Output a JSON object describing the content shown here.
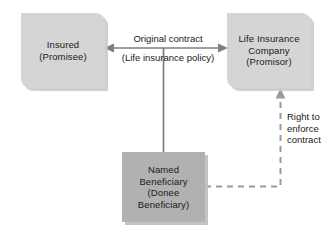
{
  "diagram": {
    "colors": {
      "box_light_fill": "#d5d5d5",
      "box_dark_fill": "#b1b1b1",
      "box_shadow": "#c8c8c8",
      "connector": "#7f7f7f",
      "text": "#1a1a1a",
      "background": "#ffffff"
    },
    "nodes": [
      {
        "id": "insured",
        "label": "Insured\n(Promisee)",
        "line1": "Insured",
        "line2": "(Promisee)",
        "style": "light"
      },
      {
        "id": "insurer",
        "label": "Life Insurance\nCompany\n(Promisor)",
        "line1": "Life Insurance",
        "line2": "Company",
        "line3": "(Promisor)",
        "style": "light"
      },
      {
        "id": "beneficiary",
        "label": "Named\nBeneficiary\n(Donee\nBeneficiary)",
        "line1": "Named",
        "line2": "Beneficiary",
        "line3": "(Donee",
        "line4": "Beneficiary)",
        "style": "dark"
      }
    ],
    "edges": [
      {
        "id": "original-contract",
        "from": "insured",
        "to": "insurer",
        "label_top": "Original contract",
        "label_bottom": "(Life insurance policy)",
        "style": "solid",
        "arrows": "both"
      },
      {
        "id": "beneficiary-link",
        "from": "beneficiary",
        "to": "original-contract",
        "label": "",
        "style": "solid",
        "arrows": "none"
      },
      {
        "id": "right-to-enforce",
        "from": "beneficiary",
        "to": "insurer",
        "label": "Right to\nenforce\ncontract",
        "label_line1": "Right to",
        "label_line2": "enforce",
        "label_line3": "contract",
        "style": "dashed",
        "arrows": "to"
      }
    ]
  }
}
